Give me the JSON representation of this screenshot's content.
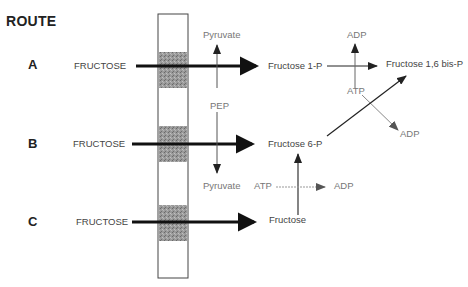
{
  "title": "ROUTE",
  "routes": [
    {
      "label": "A",
      "substrate": "FRUCTOSE",
      "product": "Fructose 1-P"
    },
    {
      "label": "B",
      "substrate": "FRUCTOSE",
      "product": "Fructose 6-P"
    },
    {
      "label": "C",
      "substrate": "FRUCTOSE",
      "product": "Fructose"
    }
  ],
  "pts_labels": {
    "pep": "PEP",
    "pyruvate_top": "Pyruvate",
    "pyruvate_bottom": "Pyruvate"
  },
  "kinase_a": {
    "adp": "ADP",
    "atp": "ATP",
    "adp2": "ADP"
  },
  "kinase_c": {
    "atp": "ATP",
    "adp": "ADP"
  },
  "final_product": "Fructose 1,6 bis-P",
  "colors": {
    "membrane_band": "#8a8a8a",
    "arrow": "#111111",
    "thin_arrow": "#555555"
  }
}
